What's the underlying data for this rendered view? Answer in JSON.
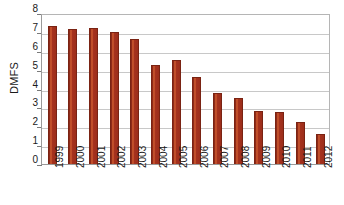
{
  "chart_data": {
    "type": "bar",
    "title": "",
    "xlabel": "",
    "ylabel": "DMFS",
    "ylim": [
      0,
      8
    ],
    "ytick_labels": [
      "8",
      "7",
      "6",
      "5",
      "4",
      "3",
      "2",
      "1",
      "0"
    ],
    "yticks": [
      8,
      7,
      6,
      5,
      4,
      3,
      2,
      1,
      0
    ],
    "grid": true,
    "legend": null,
    "bar_color": "#a6321e",
    "categories": [
      "1999",
      "2000",
      "2001",
      "2002",
      "2003",
      "2004",
      "2005",
      "2006",
      "2007",
      "2008",
      "2009",
      "2010",
      "2011",
      "2012"
    ],
    "values": [
      7.3,
      7.15,
      7.2,
      7.0,
      6.6,
      5.25,
      5.5,
      4.6,
      3.75,
      3.5,
      2.8,
      2.75,
      2.25,
      1.6
    ]
  }
}
